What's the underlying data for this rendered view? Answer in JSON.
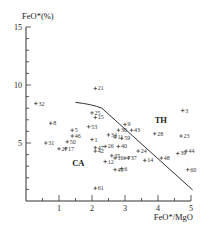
{
  "chart_data": {
    "type": "scatter",
    "title": "",
    "xlabel": "FeO*/MgO",
    "ylabel": "FeO*(%)",
    "xlim": [
      0,
      5
    ],
    "ylim": [
      0,
      15
    ],
    "x_ticks": [
      "1",
      "2",
      "3",
      "4",
      "5"
    ],
    "y_ticks": [
      "5",
      "10",
      "15"
    ],
    "grid": false,
    "legend": null,
    "regions": [
      {
        "label": "TH",
        "x": 3.9,
        "y": 6.7
      },
      {
        "label": "CA",
        "x": 1.4,
        "y": 3.0
      }
    ],
    "divider_line": [
      [
        1.5,
        8.5
      ],
      [
        2.0,
        8.35
      ],
      [
        2.3,
        8.0
      ],
      [
        5.05,
        0.95
      ]
    ],
    "points": [
      {
        "id": "32",
        "x": 0.3,
        "y": 8.4
      },
      {
        "id": "21",
        "x": 2.1,
        "y": 9.7
      },
      {
        "id": "8",
        "x": 0.75,
        "y": 6.7
      },
      {
        "id": "31",
        "x": 0.6,
        "y": 5.0
      },
      {
        "id": "5",
        "x": 1.4,
        "y": 6.1
      },
      {
        "id": "46",
        "x": 1.4,
        "y": 5.6
      },
      {
        "id": "50",
        "x": 1.25,
        "y": 5.1
      },
      {
        "id": "17",
        "x": 1.2,
        "y": 4.5
      },
      {
        "id": "27",
        "x": 1.0,
        "y": 4.5
      },
      {
        "id": "25",
        "x": 2.0,
        "y": 7.6
      },
      {
        "id": "15",
        "x": 2.1,
        "y": 7.2
      },
      {
        "id": "53",
        "x": 1.9,
        "y": 6.4
      },
      {
        "id": "1",
        "x": 2.0,
        "y": 5.3
      },
      {
        "id": "47",
        "x": 2.1,
        "y": 4.6
      },
      {
        "id": "42",
        "x": 2.1,
        "y": 4.3
      },
      {
        "id": "26",
        "x": 2.4,
        "y": 4.7
      },
      {
        "id": "34",
        "x": 2.5,
        "y": 5.7
      },
      {
        "id": "36",
        "x": 2.8,
        "y": 6.1
      },
      {
        "id": "11",
        "x": 2.7,
        "y": 5.5
      },
      {
        "id": "9",
        "x": 3.0,
        "y": 6.6
      },
      {
        "id": "43",
        "x": 3.2,
        "y": 6.1
      },
      {
        "id": "59",
        "x": 2.9,
        "y": 5.4
      },
      {
        "id": "40",
        "x": 2.8,
        "y": 4.7
      },
      {
        "id": "35",
        "x": 2.6,
        "y": 3.9
      },
      {
        "id": "16",
        "x": 2.7,
        "y": 3.7
      },
      {
        "id": "7",
        "x": 3.0,
        "y": 3.7
      },
      {
        "id": "37",
        "x": 3.1,
        "y": 3.7
      },
      {
        "id": "24",
        "x": 3.4,
        "y": 4.3
      },
      {
        "id": "12",
        "x": 2.4,
        "y": 3.4
      },
      {
        "id": "49",
        "x": 2.7,
        "y": 2.7
      },
      {
        "id": "6",
        "x": 2.9,
        "y": 2.8
      },
      {
        "id": "14",
        "x": 3.6,
        "y": 3.5
      },
      {
        "id": "48",
        "x": 4.1,
        "y": 3.7
      },
      {
        "id": "39",
        "x": 4.6,
        "y": 4.1
      },
      {
        "id": "44",
        "x": 4.85,
        "y": 4.3
      },
      {
        "id": "28",
        "x": 3.9,
        "y": 5.8
      },
      {
        "id": "23",
        "x": 4.7,
        "y": 5.6
      },
      {
        "id": "3",
        "x": 4.75,
        "y": 7.8
      },
      {
        "id": "60",
        "x": 4.9,
        "y": 2.7
      },
      {
        "id": "61",
        "x": 2.1,
        "y": 1.1
      }
    ]
  },
  "layout": {
    "origin_px": [
      26,
      201
    ],
    "px_per_x": 33,
    "px_per_y": 11.6,
    "line_color": "#333333",
    "point_color": "#333333"
  }
}
